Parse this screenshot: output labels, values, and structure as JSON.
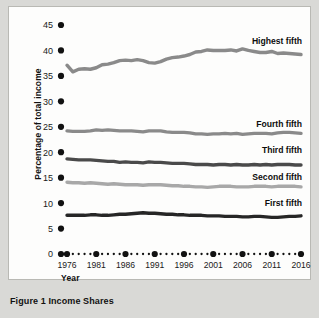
{
  "figure": {
    "caption": "Figure 1  Income Shares",
    "caption_number": "Figure 1",
    "caption_title": "Income Shares"
  },
  "axes": {
    "ylabel": "Percentage of total income",
    "xlabel": "Year",
    "yticks": [
      0,
      5,
      10,
      15,
      20,
      25,
      30,
      35,
      40,
      45
    ],
    "xticks": [
      1976,
      1981,
      1986,
      1991,
      1996,
      2001,
      2006,
      2011,
      2016
    ]
  },
  "colors": {
    "page_background": "#d9d9d6",
    "plot_background": "#fdfdfc",
    "highest_fifth": "#8a8a8a",
    "fourth_fifth": "#8a8a8a",
    "third_fifth": "#4a4a4a",
    "second_fifth": "#a8a8a8",
    "first_fifth": "#262626",
    "tick_marker": "#111111",
    "text": "#111111"
  },
  "chart_data": {
    "type": "line",
    "title": "Figure 1  Income Shares",
    "xlabel": "Year",
    "ylabel": "Percentage of total income",
    "xlim": [
      1976,
      2016
    ],
    "ylim": [
      0,
      45
    ],
    "grid": false,
    "legend": "inline-right-labels",
    "x": [
      1976,
      1977,
      1978,
      1979,
      1980,
      1981,
      1982,
      1983,
      1984,
      1985,
      1986,
      1987,
      1988,
      1989,
      1990,
      1991,
      1992,
      1993,
      1994,
      1995,
      1996,
      1997,
      1998,
      1999,
      2000,
      2001,
      2002,
      2003,
      2004,
      2005,
      2006,
      2007,
      2008,
      2009,
      2010,
      2011,
      2012,
      2013,
      2014,
      2015,
      2016
    ],
    "series": [
      {
        "name": "Highest fifth",
        "color": "#8a8a8a",
        "values": [
          37.1,
          35.8,
          36.3,
          36.4,
          36.3,
          36.6,
          37.2,
          37.3,
          37.6,
          38.0,
          38.1,
          38.0,
          38.2,
          38.0,
          37.6,
          37.5,
          37.8,
          38.3,
          38.6,
          38.7,
          38.9,
          39.2,
          39.7,
          39.8,
          40.1,
          40.0,
          40.0,
          40.0,
          40.1,
          39.9,
          40.3,
          40.0,
          39.8,
          39.6,
          39.6,
          39.8,
          39.4,
          39.5,
          39.4,
          39.3,
          39.2
        ]
      },
      {
        "name": "Fourth fifth",
        "color": "#8a8a8a",
        "values": [
          24.2,
          24.1,
          24.1,
          24.1,
          24.2,
          24.4,
          24.3,
          24.4,
          24.3,
          24.2,
          24.2,
          24.2,
          24.1,
          24.0,
          24.2,
          24.2,
          24.2,
          24.0,
          23.9,
          23.9,
          23.9,
          23.8,
          23.6,
          23.6,
          23.5,
          23.6,
          23.6,
          23.7,
          23.6,
          23.7,
          23.5,
          23.6,
          23.7,
          23.7,
          23.7,
          23.6,
          23.8,
          23.9,
          23.9,
          23.8,
          23.7
        ]
      },
      {
        "name": "Third fifth",
        "color": "#4a4a4a",
        "values": [
          18.7,
          18.6,
          18.5,
          18.5,
          18.5,
          18.4,
          18.3,
          18.2,
          18.2,
          18.0,
          18.1,
          18.0,
          18.0,
          17.9,
          18.1,
          18.0,
          18.0,
          17.9,
          17.8,
          17.8,
          17.8,
          17.7,
          17.6,
          17.6,
          17.6,
          17.5,
          17.6,
          17.6,
          17.5,
          17.6,
          17.5,
          17.5,
          17.6,
          17.5,
          17.6,
          17.5,
          17.6,
          17.6,
          17.6,
          17.5,
          17.5
        ]
      },
      {
        "name": "Second fifth",
        "color": "#a8a8a8",
        "values": [
          14.1,
          14.0,
          14.0,
          13.9,
          14.0,
          13.9,
          13.8,
          13.7,
          13.8,
          13.7,
          13.6,
          13.6,
          13.6,
          13.5,
          13.6,
          13.6,
          13.6,
          13.5,
          13.4,
          13.4,
          13.3,
          13.3,
          13.2,
          13.2,
          13.1,
          13.2,
          13.3,
          13.3,
          13.3,
          13.2,
          13.2,
          13.2,
          13.3,
          13.3,
          13.3,
          13.2,
          13.3,
          13.3,
          13.3,
          13.3,
          13.2
        ]
      },
      {
        "name": "First fifth",
        "color": "#262626",
        "values": [
          7.6,
          7.6,
          7.6,
          7.6,
          7.7,
          7.7,
          7.6,
          7.6,
          7.7,
          7.8,
          7.8,
          7.9,
          8.0,
          8.1,
          8.0,
          8.0,
          7.9,
          7.8,
          7.8,
          7.7,
          7.7,
          7.6,
          7.6,
          7.6,
          7.5,
          7.5,
          7.5,
          7.4,
          7.4,
          7.4,
          7.3,
          7.3,
          7.4,
          7.4,
          7.3,
          7.2,
          7.2,
          7.3,
          7.4,
          7.4,
          7.5
        ]
      }
    ],
    "series_label_positions": [
      {
        "name": "Highest fifth",
        "year": 2004,
        "value": 41.8
      },
      {
        "name": "Fourth fifth",
        "year": 2004,
        "value": 25.6
      },
      {
        "name": "Third fifth",
        "year": 2004,
        "value": 20.4
      },
      {
        "name": "Second fifth",
        "year": 2003,
        "value": 15.2
      },
      {
        "name": "First fifth",
        "year": 2005,
        "value": 10.1
      }
    ]
  }
}
